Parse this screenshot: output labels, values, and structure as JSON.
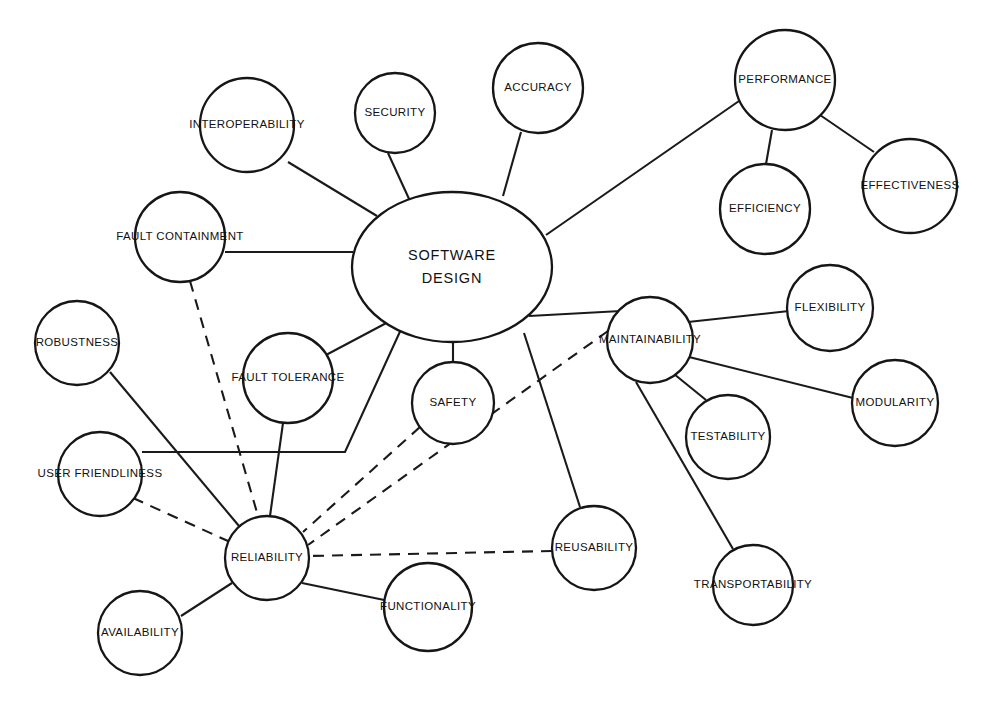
{
  "diagram": {
    "type": "concept-map",
    "background_color": "#ffffff",
    "line_color": "#1a1a1a",
    "node_fill": "#ffffff",
    "node_stroke": "#161616",
    "nodes": [
      {
        "id": "software-design",
        "label_line1": "SOFTWARE",
        "label_line2": "DESIGN",
        "label": "SOFTWARE DESIGN",
        "shape": "ellipse",
        "cx": 452,
        "cy": 267,
        "rx": 100,
        "ry": 75
      },
      {
        "id": "interoperability",
        "label": "INTEROPERABILITY",
        "shape": "circle",
        "cx": 247,
        "cy": 125,
        "r": 47
      },
      {
        "id": "security",
        "label": "SECURITY",
        "shape": "circle",
        "cx": 395,
        "cy": 113,
        "r": 40
      },
      {
        "id": "accuracy",
        "label": "ACCURACY",
        "shape": "circle",
        "cx": 538,
        "cy": 88,
        "r": 45
      },
      {
        "id": "performance",
        "label": "PERFORMANCE",
        "shape": "circle",
        "cx": 785,
        "cy": 80,
        "r": 50
      },
      {
        "id": "efficiency",
        "label": "EFFICIENCY",
        "shape": "circle",
        "cx": 765,
        "cy": 209,
        "r": 45
      },
      {
        "id": "effectiveness",
        "label": "EFFECTIVENESS",
        "shape": "circle",
        "cx": 910,
        "cy": 186,
        "r": 47
      },
      {
        "id": "fault-containment",
        "label": "FAULT CONTAINMENT",
        "shape": "circle",
        "cx": 180,
        "cy": 237,
        "r": 45
      },
      {
        "id": "maintainability",
        "label": "MAINTAINABILITY",
        "shape": "circle",
        "cx": 650,
        "cy": 340,
        "r": 43
      },
      {
        "id": "flexibility",
        "label": "FLEXIBILITY",
        "shape": "circle",
        "cx": 830,
        "cy": 308,
        "r": 43
      },
      {
        "id": "robustness",
        "label": "ROBUSTNESS",
        "shape": "circle",
        "cx": 77,
        "cy": 343,
        "r": 42
      },
      {
        "id": "fault-tolerance",
        "label": "FAULT TOLERANCE",
        "shape": "circle",
        "cx": 288,
        "cy": 378,
        "r": 45
      },
      {
        "id": "safety",
        "label": "SAFETY",
        "shape": "circle",
        "cx": 453,
        "cy": 403,
        "r": 41
      },
      {
        "id": "modularity",
        "label": "MODULARITY",
        "shape": "circle",
        "cx": 895,
        "cy": 403,
        "r": 43
      },
      {
        "id": "testability",
        "label": "TESTABILITY",
        "shape": "circle",
        "cx": 728,
        "cy": 437,
        "r": 42
      },
      {
        "id": "user-friendliness",
        "label": "USER FRIENDLINESS",
        "shape": "circle",
        "cx": 100,
        "cy": 474,
        "r": 42
      },
      {
        "id": "reliability",
        "label": "RELIABILITY",
        "shape": "circle",
        "cx": 267,
        "cy": 558,
        "r": 42
      },
      {
        "id": "reusability",
        "label": "REUSABILITY",
        "shape": "circle",
        "cx": 594,
        "cy": 548,
        "r": 42
      },
      {
        "id": "transportability",
        "label": "TRANSPORTABILITY",
        "shape": "circle",
        "cx": 753,
        "cy": 585,
        "r": 40
      },
      {
        "id": "functionality",
        "label": "FUNCTIONALITY",
        "shape": "circle",
        "cx": 428,
        "cy": 607,
        "r": 44
      },
      {
        "id": "availability",
        "label": "AVAILABILITY",
        "shape": "circle",
        "cx": 140,
        "cy": 633,
        "r": 42
      }
    ],
    "edges": [
      {
        "id": "e-sd-interoperability",
        "from": "interoperability",
        "to": "software-design",
        "style": "solid",
        "points": "288,162 377,216"
      },
      {
        "id": "e-sd-security",
        "from": "security",
        "to": "software-design",
        "style": "solid",
        "points": "388,153 410,201"
      },
      {
        "id": "e-sd-accuracy",
        "from": "accuracy",
        "to": "software-design",
        "style": "solid",
        "points": "521,132 503,196"
      },
      {
        "id": "e-sd-performance",
        "from": "performance",
        "to": "software-design",
        "style": "solid",
        "points": "739,101 546,235"
      },
      {
        "id": "e-performance-efficiency",
        "from": "performance",
        "to": "efficiency",
        "style": "solid",
        "points": "772,130 766,164"
      },
      {
        "id": "e-performance-effectiveness",
        "from": "performance",
        "to": "effectiveness",
        "style": "solid",
        "points": "820,115 874,152"
      },
      {
        "id": "e-sd-fault-containment",
        "from": "fault-containment",
        "to": "software-design",
        "style": "solid",
        "points": "225,252 353,252"
      },
      {
        "id": "e-fault-containment-reliability",
        "from": "fault-containment",
        "to": "reliability",
        "style": "dashed",
        "points": "190,281 258,516"
      },
      {
        "id": "e-sd-maintainability",
        "from": "maintainability",
        "to": "software-design",
        "style": "solid",
        "points": "621,311 529,316"
      },
      {
        "id": "e-maintainability-flexibility",
        "from": "maintainability",
        "to": "flexibility",
        "style": "solid",
        "points": "688,322 789,311"
      },
      {
        "id": "e-maintainability-modularity",
        "from": "maintainability",
        "to": "modularity",
        "style": "solid",
        "points": "689,357 853,398"
      },
      {
        "id": "e-maintainability-testability",
        "from": "maintainability",
        "to": "testability",
        "style": "solid",
        "points": "674,374 706,400"
      },
      {
        "id": "e-maintainability-transportability",
        "from": "maintainability",
        "to": "transportability",
        "style": "solid",
        "points": "636,382 733,549"
      },
      {
        "id": "e-maintainability-reliability",
        "from": "maintainability",
        "to": "reliability",
        "style": "dashed",
        "points": "608,331 308,545"
      },
      {
        "id": "e-robustness-reliability",
        "from": "robustness",
        "to": "reliability",
        "style": "solid",
        "points": "110,372 239,526"
      },
      {
        "id": "e-sd-fault-tolerance",
        "from": "fault-tolerance",
        "to": "software-design",
        "style": "solid",
        "points": "326,355 392,320"
      },
      {
        "id": "e-fault-tolerance-reliability",
        "from": "fault-tolerance",
        "to": "reliability",
        "style": "solid",
        "points": "283,423 270,516"
      },
      {
        "id": "e-sd-safety",
        "from": "safety",
        "to": "software-design",
        "style": "solid",
        "points": "453,362 453,341"
      },
      {
        "id": "e-safety-reliability",
        "from": "safety",
        "to": "reliability",
        "style": "dashed",
        "points": "420,427 303,532"
      },
      {
        "id": "e-user-friendliness-sd",
        "from": "user-friendliness",
        "to": "software-design",
        "style": "solid",
        "points": "142,452 345,452 403,325"
      },
      {
        "id": "e-user-friendliness-reliability",
        "from": "user-friendliness",
        "to": "reliability",
        "style": "dashed",
        "points": "133,498 228,541"
      },
      {
        "id": "e-sd-reusability",
        "from": "reusability",
        "to": "software-design",
        "style": "solid",
        "points": "580,507 524,333"
      },
      {
        "id": "e-reusability-reliability",
        "from": "reusability",
        "to": "reliability",
        "style": "dashed",
        "points": "552,551 309,556"
      },
      {
        "id": "e-reliability-functionality",
        "from": "reliability",
        "to": "functionality",
        "style": "solid",
        "points": "302,583 389,601"
      },
      {
        "id": "e-reliability-availability",
        "from": "reliability",
        "to": "availability",
        "style": "solid",
        "points": "232,583 181,616"
      }
    ],
    "legend": {
      "solid_meaning": "solid line",
      "dashed_meaning": "dashed line"
    }
  }
}
